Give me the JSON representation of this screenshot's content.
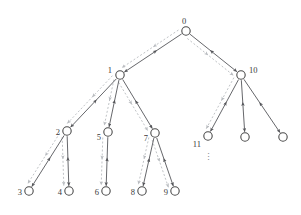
{
  "figure": {
    "title": "",
    "background_color": "#ffffff",
    "node_stroke_color": "#4a4a4a",
    "node_fill_color": "#ffffff",
    "solid_edge_color": "#55565a",
    "dashed_edge_color": "#b9bcc0",
    "label_color": "#3a3a3a",
    "ellipsis_glyph": "⋮"
  },
  "nodes": [
    {
      "id": "0",
      "label": "0",
      "x": 186,
      "y": 31,
      "r": 4.2,
      "label_dx": -2,
      "label_dy": -7,
      "label_anchor": "middle",
      "labeled": true
    },
    {
      "id": "1",
      "label": "1",
      "x": 120,
      "y": 75,
      "r": 4.2,
      "label_dx": -8,
      "label_dy": -2,
      "label_anchor": "end",
      "labeled": true
    },
    {
      "id": "10",
      "label": "10",
      "x": 241,
      "y": 75,
      "r": 4.2,
      "label_dx": 8,
      "label_dy": -2,
      "label_anchor": "start",
      "labeled": true
    },
    {
      "id": "2",
      "label": "2",
      "x": 67,
      "y": 131,
      "r": 4.2,
      "label_dx": -7,
      "label_dy": 4,
      "label_anchor": "end",
      "labeled": true
    },
    {
      "id": "5",
      "label": "5",
      "x": 108,
      "y": 132,
      "r": 4.2,
      "label_dx": -7,
      "label_dy": 8,
      "label_anchor": "end",
      "labeled": true
    },
    {
      "id": "7",
      "label": "7",
      "x": 155,
      "y": 133,
      "r": 4.2,
      "label_dx": -7,
      "label_dy": 8,
      "label_anchor": "end",
      "labeled": true
    },
    {
      "id": "11",
      "label": "11",
      "x": 208,
      "y": 136,
      "r": 4.2,
      "label_dx": -7,
      "label_dy": 11,
      "label_anchor": "end",
      "labeled": true
    },
    {
      "id": "u1",
      "label": "",
      "x": 245,
      "y": 137,
      "r": 4.2,
      "label_dx": 0,
      "label_dy": 0,
      "label_anchor": "middle",
      "labeled": false
    },
    {
      "id": "u2",
      "label": "",
      "x": 283,
      "y": 137,
      "r": 4.2,
      "label_dx": 0,
      "label_dy": 0,
      "label_anchor": "middle",
      "labeled": false
    },
    {
      "id": "3",
      "label": "3",
      "x": 29,
      "y": 191,
      "r": 4.2,
      "label_dx": -7,
      "label_dy": 4,
      "label_anchor": "end",
      "labeled": true
    },
    {
      "id": "4",
      "label": "4",
      "x": 69,
      "y": 191,
      "r": 4.2,
      "label_dx": -7,
      "label_dy": 4,
      "label_anchor": "end",
      "labeled": true
    },
    {
      "id": "6",
      "label": "6",
      "x": 106,
      "y": 191,
      "r": 4.2,
      "label_dx": -7,
      "label_dy": 4,
      "label_anchor": "end",
      "labeled": true
    },
    {
      "id": "8",
      "label": "8",
      "x": 142,
      "y": 191,
      "r": 4.2,
      "label_dx": -7,
      "label_dy": 4,
      "label_anchor": "end",
      "labeled": true
    },
    {
      "id": "9",
      "label": "9",
      "x": 175,
      "y": 191,
      "r": 4.2,
      "label_dx": -7,
      "label_dy": 4,
      "label_anchor": "end",
      "labeled": true
    }
  ],
  "edges": [
    {
      "from": "0",
      "to": "1",
      "style": "solid"
    },
    {
      "from": "0",
      "to": "10",
      "style": "solid"
    },
    {
      "from": "1",
      "to": "2",
      "style": "solid"
    },
    {
      "from": "1",
      "to": "5",
      "style": "solid"
    },
    {
      "from": "1",
      "to": "7",
      "style": "solid"
    },
    {
      "from": "10",
      "to": "11",
      "style": "solid"
    },
    {
      "from": "10",
      "to": "u1",
      "style": "solid"
    },
    {
      "from": "10",
      "to": "u2",
      "style": "solid"
    },
    {
      "from": "2",
      "to": "3",
      "style": "solid"
    },
    {
      "from": "2",
      "to": "4",
      "style": "solid"
    },
    {
      "from": "5",
      "to": "6",
      "style": "solid"
    },
    {
      "from": "7",
      "to": "8",
      "style": "solid"
    },
    {
      "from": "7",
      "to": "9",
      "style": "solid"
    }
  ],
  "dashed_edges": [
    {
      "from": "0",
      "to": "1",
      "offset": 5
    },
    {
      "from": "0",
      "to": "10",
      "offset": 5
    },
    {
      "from": "1",
      "to": "2",
      "offset": 5
    },
    {
      "from": "1",
      "to": "5",
      "offset": 5
    },
    {
      "from": "1",
      "to": "7",
      "offset": 5
    },
    {
      "from": "10",
      "to": "11",
      "offset": 5
    },
    {
      "from": "2",
      "to": "3",
      "offset": 5
    },
    {
      "from": "2",
      "to": "4",
      "offset": 5
    },
    {
      "from": "5",
      "to": "6",
      "offset": 5
    },
    {
      "from": "7",
      "to": "8",
      "offset": 5
    },
    {
      "from": "7",
      "to": "9",
      "offset": 5
    }
  ],
  "ellipsis": [
    {
      "x": 208,
      "y": 160
    }
  ]
}
